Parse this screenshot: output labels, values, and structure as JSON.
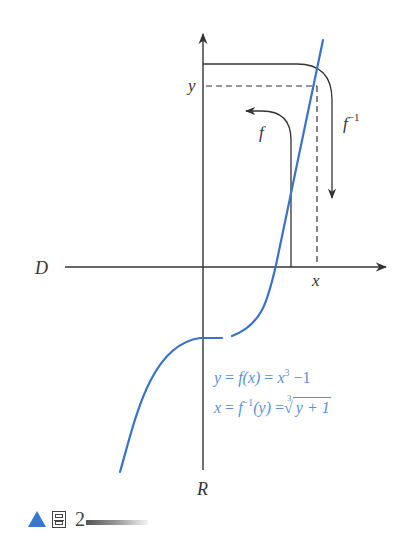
{
  "figure": {
    "axes": {
      "horizontal_label": "D",
      "vertical_label": "R",
      "x_marker": "x",
      "y_marker": "y"
    },
    "arrows": {
      "forward_label": "f",
      "inverse_label": "f",
      "inverse_superscript": "−1"
    },
    "equations": {
      "eq1": {
        "lhs": "y",
        "eq_sign": " = ",
        "func": "f(x)",
        "eq_sign2": " = ",
        "base": "x",
        "exponent": "3",
        "tail": " −1"
      },
      "eq2": {
        "lhs": "x",
        "eq_sign": " = ",
        "func": "f",
        "func_sup": "−1",
        "arg": "(y)",
        "eq_sign2": " =",
        "root_index": "3",
        "radicand": "y + 1"
      }
    },
    "curve_color": "#3a72c8",
    "equation_color": "#5b8fd6"
  },
  "caption": {
    "marker": "▲",
    "word": "圖",
    "number": "2"
  }
}
